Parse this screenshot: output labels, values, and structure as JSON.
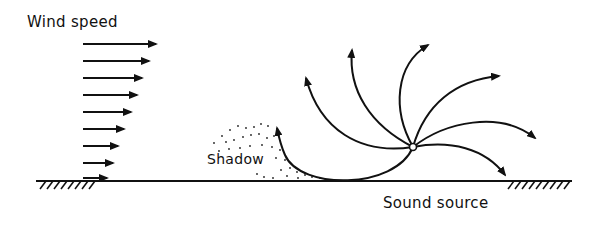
{
  "labels": {
    "wind_speed": "Wind speed",
    "shadow": "Shadow",
    "sound_source": "Sound source"
  },
  "diagram": {
    "type": "sound ray refraction by wind gradient",
    "wind_profile_arrows": 9,
    "rays": 7,
    "colors": {
      "ink": "#111111",
      "background": "#ffffff"
    }
  }
}
